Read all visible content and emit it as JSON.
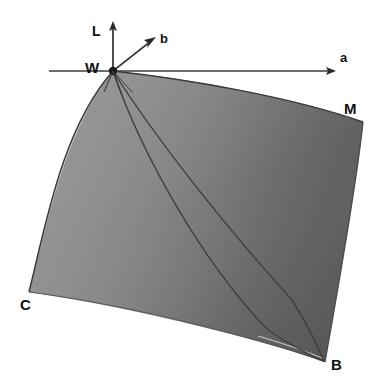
{
  "figure": {
    "background_color": "#ffffff",
    "width": 381,
    "height": 392
  },
  "axes": [
    {
      "id": "L",
      "label": "L",
      "direction": "up",
      "origin": [
        113,
        71
      ],
      "tip": [
        113,
        22
      ],
      "label_pos": [
        92,
        24
      ]
    },
    {
      "id": "b",
      "label": "b",
      "direction": "up-right",
      "origin": [
        113,
        71
      ],
      "tip": [
        156,
        36
      ],
      "label_pos": [
        160,
        32
      ]
    },
    {
      "id": "a",
      "label": "a",
      "direction": "right",
      "origin": [
        113,
        71
      ],
      "tip": [
        337,
        71
      ],
      "label_pos": [
        340,
        51
      ]
    }
  ],
  "vertices": [
    {
      "id": "W",
      "label": "W",
      "point": [
        113,
        71
      ],
      "label_pos": [
        85,
        60
      ],
      "name": "white-point"
    },
    {
      "id": "M",
      "label": "M",
      "point": [
        363,
        122
      ],
      "label_pos": [
        344,
        101
      ],
      "name": "magenta-point"
    },
    {
      "id": "C",
      "label": "C",
      "point": [
        29,
        292
      ],
      "label_pos": [
        20,
        297
      ],
      "name": "cyan-point"
    },
    {
      "id": "B",
      "label": "B",
      "point": [
        325,
        362
      ],
      "label_pos": [
        331,
        357
      ],
      "name": "blue-point"
    }
  ],
  "surface": {
    "name": "gamut-surface",
    "fill_light": "#d4d4d4",
    "fill_mid": "#a8a8a8",
    "fill_dark": "#636363",
    "edge_color": "#3a3a3a",
    "interior_curves": 2
  },
  "colors": {
    "axis_line": "#3d3d3d",
    "text": "#111111",
    "origin_dot": "#1a1a1a",
    "background": "#ffffff"
  },
  "icons": {
    "axis_arrow": "arrow-head-icon",
    "origin_marker": "origin-dot-icon"
  }
}
